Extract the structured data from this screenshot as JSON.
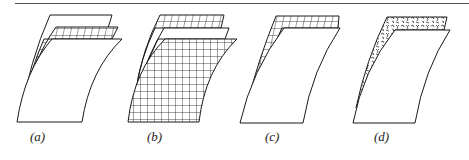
{
  "figure": {
    "panels": [
      {
        "id": "a",
        "label": "(a)",
        "description": "single sheet with gridded thin layer along top edge"
      },
      {
        "id": "b",
        "label": "(b)",
        "description": "fully gridded sheet with gridded top layers"
      },
      {
        "id": "c",
        "label": "(c)",
        "description": "sheet with gridded top band"
      },
      {
        "id": "d",
        "label": "(d)",
        "description": "sheet with irregular textured top band"
      }
    ],
    "labels": {
      "a": "(a)",
      "b": "(b)",
      "c": "(c)",
      "d": "(d)"
    },
    "colors": {
      "line": "#1a1a1a",
      "background": "#ffffff",
      "rule": "#555555"
    }
  }
}
